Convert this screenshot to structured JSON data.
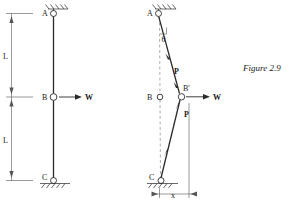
{
  "figure": {
    "caption": "Figure 2.9",
    "accent_color": "#2a2a2a",
    "background": "#ffffff"
  },
  "left_diagram": {
    "name": "undeformed-two-member-column",
    "nodes": [
      {
        "id": "A",
        "label": "A",
        "support": "pin-fixed-hatched",
        "x": 53,
        "y": 17
      },
      {
        "id": "B",
        "label": "B",
        "support": "hinge",
        "x": 53,
        "y": 97
      },
      {
        "id": "C",
        "label": "C",
        "support": "pin-ground-hatched",
        "x": 53,
        "y": 180
      }
    ],
    "load": {
      "label": "W",
      "direction": "right",
      "at": "B"
    },
    "dimensions": [
      {
        "label": "L",
        "from": "A",
        "to": "B"
      },
      {
        "label": "L",
        "from": "B",
        "to": "C"
      }
    ]
  },
  "right_diagram": {
    "name": "deformed-two-member-column",
    "nodes": [
      {
        "id": "A",
        "label": "A",
        "support": "pin-fixed-hatched",
        "x": 158,
        "y": 17
      },
      {
        "id": "B",
        "label": "B",
        "support": "original-position-hinge",
        "x": 160,
        "y": 97
      },
      {
        "id": "Bp",
        "label": "B'",
        "support": "displaced-hinge",
        "x": 182,
        "y": 96
      },
      {
        "id": "C",
        "label": "C",
        "support": "pin-ground-hatched",
        "x": 161,
        "y": 180
      }
    ],
    "angle_label": "θ",
    "member_forces": [
      {
        "label": "P",
        "member": "A-B'",
        "arrow": "toward-B'"
      },
      {
        "label": "P",
        "member": "C-B'",
        "arrow": "toward-B'"
      }
    ],
    "load": {
      "label": "W",
      "direction": "right",
      "at": "B'"
    },
    "dimensions": [
      {
        "label": "x",
        "from": "C-vertical",
        "to": "B'-vertical"
      }
    ]
  }
}
